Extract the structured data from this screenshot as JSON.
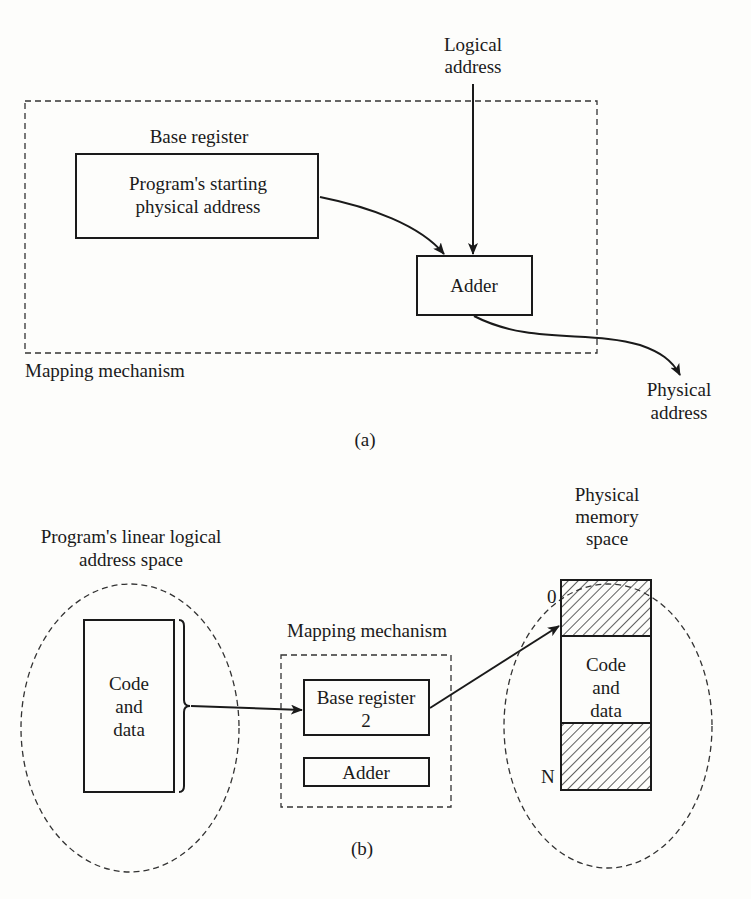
{
  "figure_a": {
    "logical_address_label": [
      "Logical",
      "address"
    ],
    "base_register_label": "Base register",
    "base_register_content": [
      "Program's starting",
      "physical address"
    ],
    "adder_label": "Adder",
    "mapping_mechanism_label": "Mapping mechanism",
    "physical_address_label": [
      "Physical",
      "address"
    ],
    "caption": "(a)"
  },
  "figure_b": {
    "logical_space_title": [
      "Program's linear logical",
      "address space"
    ],
    "logical_block_label": [
      "Code",
      "and",
      "data"
    ],
    "mapping_mechanism_label": "Mapping mechanism",
    "base_register_label": [
      "Base register",
      "2"
    ],
    "adder_label": "Adder",
    "physical_space_title": [
      "Physical",
      "memory",
      "space"
    ],
    "memory_block_label": [
      "Code",
      "and",
      "data"
    ],
    "address_start_label": "0",
    "address_end_label": "N",
    "caption": "(b)"
  },
  "colors": {
    "ink": "#1a1a1a",
    "paper": "#fdfdfb"
  }
}
